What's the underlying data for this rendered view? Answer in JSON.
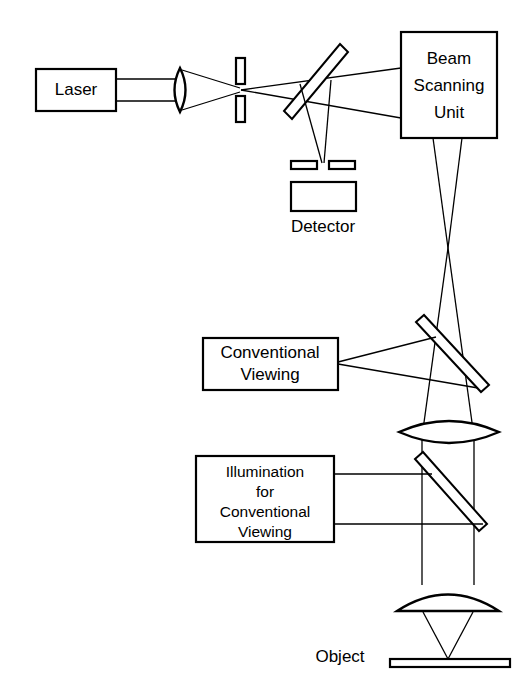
{
  "diagram": {
    "background_color": "#ffffff",
    "line_color": "#000000",
    "width": 532,
    "height": 694,
    "components": {
      "laser": {
        "label": "Laser",
        "type": "source-box"
      },
      "beam_scanning_unit": {
        "label_line1": "Beam",
        "label_line2": "Scanning",
        "label_line3": "Unit",
        "type": "module-box"
      },
      "detector": {
        "label": "Detector",
        "type": "detector-box",
        "label_position": "below"
      },
      "conventional_viewing": {
        "label_line1": "Conventional",
        "label_line2": "Viewing",
        "type": "module-box"
      },
      "illumination_for_conventional_viewing": {
        "label_line1": "Illumination",
        "label_line2": "for",
        "label_line3": "Conventional",
        "label_line4": "Viewing",
        "type": "module-box"
      },
      "object": {
        "label": "Object",
        "type": "specimen-plane",
        "label_position": "left"
      },
      "focusing_lens": {
        "type": "biconvex-lens",
        "name": "laser-focusing-lens"
      },
      "pinhole_excitation": {
        "type": "pinhole-aperture",
        "name": "excitation-pinhole"
      },
      "pinhole_detection": {
        "type": "pinhole-aperture",
        "name": "detection-pinhole"
      },
      "beamsplitter_dichroic": {
        "type": "tilted-plate",
        "name": "dichroic-beamsplitter"
      },
      "beamsplitter_viewing": {
        "type": "tilted-plate",
        "name": "viewing-beamsplitter"
      },
      "beamsplitter_illumination": {
        "type": "tilted-plate",
        "name": "illumination-beamsplitter"
      },
      "tube_lens": {
        "type": "biconvex-lens",
        "name": "tube-lens"
      },
      "objective_lens": {
        "type": "plano-convex-lens",
        "name": "objective-lens"
      }
    }
  }
}
